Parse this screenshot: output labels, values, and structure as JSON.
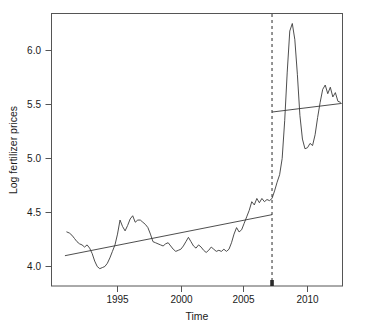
{
  "chart_data": {
    "type": "line",
    "title": "",
    "subtitle": "",
    "xlabel": "Time",
    "ylabel": "Log fertilizer prices",
    "xlim": [
      1990.8,
      1990.8
    ],
    "ylim": [
      3.93,
      6.32
    ],
    "xticks": [
      1995,
      2000,
      2005,
      2010
    ],
    "xtick_labels": [
      "1995",
      "2000",
      "2005",
      "2010"
    ],
    "yticks": [
      4.0,
      4.5,
      5.0,
      5.5,
      6.0
    ],
    "ytick_labels": [
      "4.0",
      "4.5",
      "5.0",
      "5.5",
      "6.0"
    ],
    "grid": false,
    "legend": "none",
    "x_axis_range": [
      1990.8,
      1991.0
    ],
    "series": [
      {
        "name": "Log fertilizer prices",
        "color": "#3a3a3a",
        "style": "solid",
        "x": [
          1991.0,
          1991.2,
          1991.4,
          1991.6,
          1991.8,
          1992.0,
          1992.2,
          1992.4,
          1992.6,
          1992.8,
          1993.0,
          1993.2,
          1993.4,
          1993.6,
          1993.8,
          1994.0,
          1994.2,
          1994.4,
          1994.6,
          1994.8,
          1995.0,
          1995.2,
          1995.4,
          1995.6,
          1995.8,
          1996.0,
          1996.2,
          1996.4,
          1996.6,
          1996.8,
          1997.0,
          1997.2,
          1997.4,
          1997.6,
          1997.8,
          1998.0,
          1998.2,
          1998.4,
          1998.6,
          1998.8,
          1999.0,
          1999.2,
          1999.4,
          1999.6,
          1999.8,
          2000.0,
          2000.2,
          2000.4,
          2000.6,
          2000.8,
          2001.0,
          2001.2,
          2001.4,
          2001.6,
          2001.8,
          2002.0,
          2002.2,
          2002.4,
          2002.6,
          2002.8,
          2003.0,
          2003.2,
          2003.4,
          2003.6,
          2003.8,
          2004.0,
          2004.2,
          2004.4,
          2004.6,
          2004.8,
          2005.0,
          2005.2,
          2005.4,
          2005.6,
          2005.8,
          2006.0,
          2006.2,
          2006.4,
          2006.6,
          2006.8,
          2007.0,
          2007.2,
          2007.4,
          2007.6,
          2007.8,
          2008.0,
          2008.2,
          2008.4,
          2008.6,
          2008.8,
          2009.0,
          2009.2,
          2009.4,
          2009.6,
          2009.8,
          2010.0,
          2010.2,
          2010.4,
          2010.6,
          2010.8,
          2011.0,
          2011.2,
          2011.4,
          2011.6,
          2011.8,
          2012.0,
          2012.2,
          2012.4,
          2012.6
        ],
        "y": [
          4.32,
          4.31,
          4.29,
          4.26,
          4.23,
          4.21,
          4.2,
          4.18,
          4.2,
          4.17,
          4.12,
          4.05,
          4.0,
          3.98,
          3.99,
          4.0,
          4.03,
          4.08,
          4.14,
          4.2,
          4.3,
          4.43,
          4.37,
          4.33,
          4.38,
          4.44,
          4.47,
          4.41,
          4.43,
          4.43,
          4.41,
          4.39,
          4.36,
          4.3,
          4.23,
          4.22,
          4.21,
          4.2,
          4.19,
          4.21,
          4.22,
          4.19,
          4.16,
          4.14,
          4.15,
          4.16,
          4.19,
          4.23,
          4.27,
          4.23,
          4.19,
          4.17,
          4.2,
          4.18,
          4.15,
          4.13,
          4.15,
          4.18,
          4.16,
          4.14,
          4.15,
          4.14,
          4.16,
          4.14,
          4.16,
          4.22,
          4.3,
          4.36,
          4.32,
          4.34,
          4.4,
          4.46,
          4.52,
          4.6,
          4.57,
          4.63,
          4.59,
          4.63,
          4.6,
          4.62,
          4.61,
          4.63,
          4.7,
          4.78,
          4.85,
          5.0,
          5.35,
          5.8,
          6.18,
          6.25,
          6.1,
          5.78,
          5.4,
          5.18,
          5.09,
          5.1,
          5.14,
          5.12,
          5.22,
          5.38,
          5.52,
          5.64,
          5.68,
          5.6,
          5.66,
          5.57,
          5.61,
          5.53,
          5.52
        ]
      }
    ],
    "annotations": [
      {
        "name": "structural-break-line",
        "type": "vertical-dashed-line",
        "x": 2007.2,
        "label": ""
      },
      {
        "name": "trend-segment-before-break",
        "type": "line-segment",
        "x": [
          1990.85,
          2007.2
        ],
        "y": [
          4.1,
          4.48
        ]
      },
      {
        "name": "trend-segment-after-break",
        "type": "line-segment",
        "x": [
          2007.2,
          2012.7
        ],
        "y": [
          5.43,
          5.51
        ]
      }
    ]
  },
  "axis": {
    "y_title": "Log fertilizer prices",
    "x_title": "Time",
    "y_labels": [
      "6.0",
      "5.5",
      "5.0",
      "4.5",
      "4.0"
    ],
    "x_labels": [
      "1995",
      "2000",
      "2005",
      "2010"
    ]
  },
  "colors": {
    "line": "#3a3a3a",
    "frame": "#555555",
    "text": "#1a1a1a",
    "background": "#ffffff"
  }
}
